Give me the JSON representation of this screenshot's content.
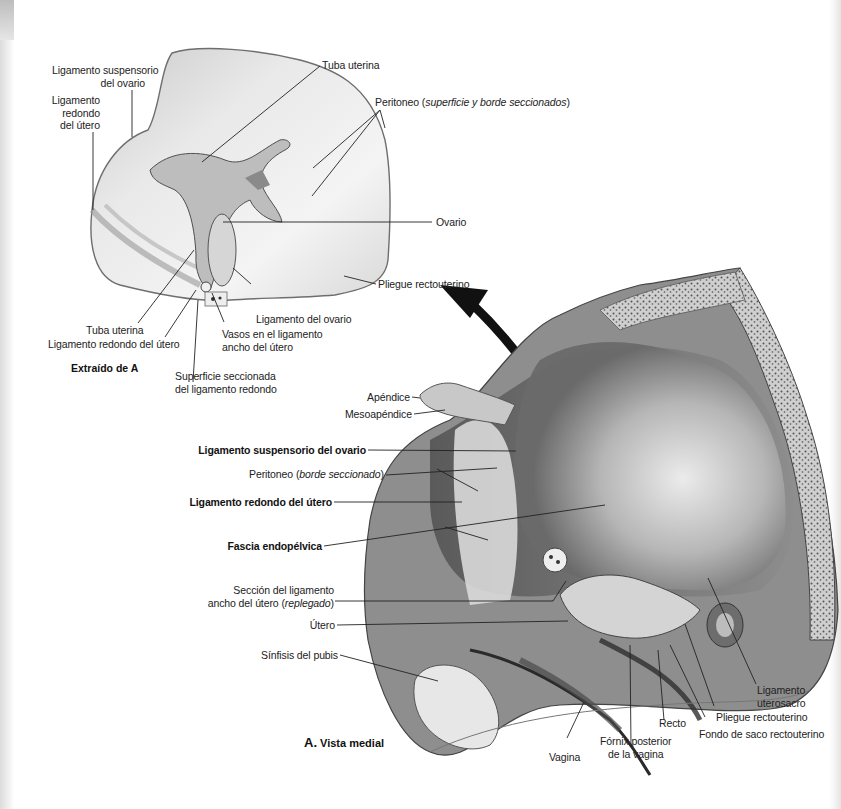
{
  "figure": {
    "inset": {
      "caption": "Extraído de A",
      "labels": {
        "tuba_uterina_top": "Tuba uterina",
        "lig_suspensorio_1": "Ligamento suspensorio",
        "lig_suspensorio_2": "del ovario",
        "lig_redondo_1": "Ligamento",
        "lig_redondo_2": "redondo",
        "lig_redondo_3": "del útero",
        "peritoneo_prefix": "Peritoneo (",
        "peritoneo_italic": "superficie y borde seccionados",
        "peritoneo_suffix": ")",
        "ovario": "Ovario",
        "pliegue_rectouterino": "Pliegue rectouterino",
        "lig_ovario": "Ligamento del ovario",
        "tuba_uterina_bottom": "Tuba uterina",
        "lig_redondo_bottom": "Ligamento redondo del útero",
        "vasos_1": "Vasos en el ligamento",
        "vasos_2": "ancho del útero",
        "superficie_1": "Superficie seccionada",
        "superficie_2": "del ligamento redondo"
      }
    },
    "main": {
      "caption_letter": "A.",
      "caption_text": "Vista medial",
      "labels": {
        "apendice": "Apéndice",
        "mesoapendice": "Mesoapéndice",
        "lig_suspensorio_ovario": "Ligamento suspensorio del ovario",
        "peritoneo_prefix": "Peritoneo (",
        "peritoneo_italic": "borde seccionado",
        "peritoneo_suffix": ")",
        "lig_redondo_utero": "Ligamento redondo del útero",
        "fascia_endopelvica": "Fascia endopélvica",
        "seccion_lig_1": "Sección del ligamento",
        "seccion_lig_2_prefix": "ancho del útero (",
        "seccion_lig_2_italic": "replegado",
        "seccion_lig_2_suffix": ")",
        "utero": "Útero",
        "sinfisis_pubis": "Sínfisis del pubis",
        "vagina": "Vagina",
        "fornix_1": "Fórnix posterior",
        "fornix_2": "de la vagina",
        "recto": "Recto",
        "fondo_saco": "Fondo de saco rectouterino",
        "pliegue_rectouterino": "Pliegue rectouterino",
        "lig_uterosacro_1": "Ligamento",
        "lig_uterosacro_2": "uterosacro"
      }
    },
    "colors": {
      "leader_line": "#222222",
      "arrow": "#111111",
      "illustration_light": "#e8e8e8",
      "illustration_mid": "#a9a9a9",
      "illustration_dark": "#4a4a4a"
    }
  }
}
